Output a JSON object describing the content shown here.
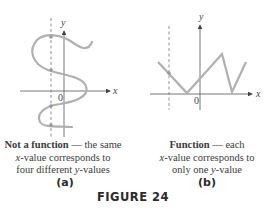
{
  "figure": {
    "title": "FIGURE 24",
    "panels": [
      {
        "id": "a",
        "label": "(a)",
        "caption_bold": "Not a function",
        "caption_rest_line1": " — the same",
        "caption_line2_var": "x",
        "caption_line2_rest": "-value corresponds to",
        "caption_line3_pre": "four different ",
        "caption_line3_var": "y",
        "caption_line3_rest": "-values",
        "axis_x_label": "x",
        "axis_y_label": "y",
        "origin_label": "0"
      },
      {
        "id": "b",
        "label": "(b)",
        "caption_bold": "Function",
        "caption_rest_line1": " — each",
        "caption_line2_var": "x",
        "caption_line2_rest": "-value corresponds to",
        "caption_line3_pre": "only one ",
        "caption_line3_var": "y",
        "caption_line3_rest": "-value",
        "axis_x_label": "x",
        "axis_y_label": "y",
        "origin_label": "0"
      }
    ],
    "colors": {
      "curve": "#b0b0b0",
      "axis": "#555555",
      "text": "#3a3a3a"
    }
  }
}
